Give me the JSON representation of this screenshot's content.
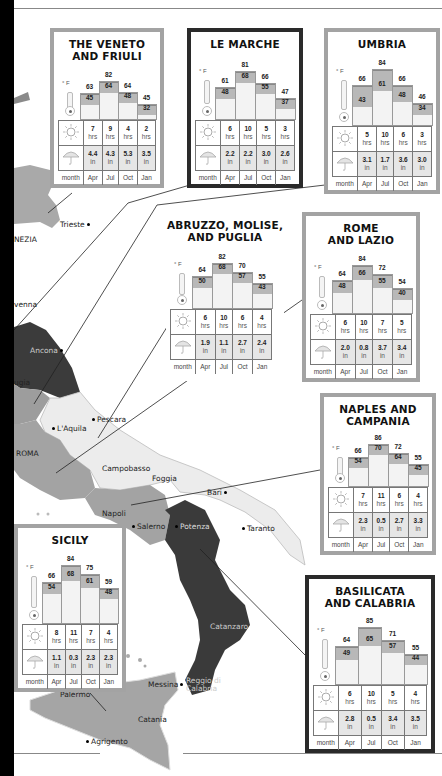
{
  "map": {
    "places": [
      {
        "name": "Trieste",
        "x": 60,
        "y": 224
      },
      {
        "name": "NEZIA",
        "x": 14,
        "y": 238
      },
      {
        "name": "venna",
        "x": 14,
        "y": 303
      },
      {
        "name": "Ancona",
        "x": 30,
        "y": 349
      },
      {
        "name": "ugia",
        "x": 14,
        "y": 381
      },
      {
        "name": "Pescara",
        "x": 94,
        "y": 418
      },
      {
        "name": "L'Aquila",
        "x": 54,
        "y": 427
      },
      {
        "name": "ROMA",
        "x": 16,
        "y": 452
      },
      {
        "name": "Campobasso",
        "x": 102,
        "y": 467
      },
      {
        "name": "Foggia",
        "x": 152,
        "y": 478
      },
      {
        "name": "Bari",
        "x": 207,
        "y": 491
      },
      {
        "name": "Napoli",
        "x": 102,
        "y": 512
      },
      {
        "name": "Salerno",
        "x": 135,
        "y": 525
      },
      {
        "name": "Potenza",
        "x": 178,
        "y": 525
      },
      {
        "name": "Taranto",
        "x": 245,
        "y": 527
      },
      {
        "name": "Catanzaro",
        "x": 210,
        "y": 625
      },
      {
        "name": "Messina",
        "x": 150,
        "y": 683
      },
      {
        "name": "Reggio di Calabria",
        "x": 186,
        "y": 680
      },
      {
        "name": "Palermo",
        "x": 60,
        "y": 693
      },
      {
        "name": "Catania",
        "x": 138,
        "y": 718
      },
      {
        "name": "Agrigento",
        "x": 88,
        "y": 740
      }
    ]
  },
  "climate_legend": {
    "unit_temp": "° F",
    "sun_unit": "hrs",
    "rain_unit": "in",
    "month_label": "month",
    "months": [
      "Apr",
      "Jul",
      "Oct",
      "Jan"
    ],
    "icons": [
      "thermometer-icon",
      "sun-icon",
      "umbrella-icon"
    ]
  },
  "chart_data": [
    {
      "type": "bar",
      "title": "THE VENETO AND FRIULI",
      "categories": [
        "Apr",
        "Jul",
        "Oct",
        "Jan"
      ],
      "series": [
        {
          "name": "high °F",
          "values": [
            63,
            82,
            64,
            45
          ]
        },
        {
          "name": "low °F",
          "values": [
            45,
            64,
            48,
            32
          ]
        },
        {
          "name": "sunshine hrs",
          "values": [
            7,
            9,
            4,
            2
          ]
        },
        {
          "name": "rainfall in",
          "values": [
            4.4,
            4.3,
            5.3,
            3.5
          ]
        }
      ]
    },
    {
      "type": "bar",
      "title": "LE MARCHE",
      "categories": [
        "Apr",
        "Jul",
        "Oct",
        "Jan"
      ],
      "series": [
        {
          "name": "high °F",
          "values": [
            61,
            81,
            66,
            47
          ]
        },
        {
          "name": "low °F",
          "values": [
            48,
            68,
            55,
            37
          ]
        },
        {
          "name": "sunshine hrs",
          "values": [
            6,
            10,
            5,
            3
          ]
        },
        {
          "name": "rainfall in",
          "values": [
            2.2,
            2.2,
            3.0,
            2.6
          ]
        }
      ]
    },
    {
      "type": "bar",
      "title": "UMBRIA",
      "categories": [
        "Apr",
        "Jul",
        "Oct",
        "Jan"
      ],
      "series": [
        {
          "name": "high °F",
          "values": [
            66,
            84,
            66,
            46
          ]
        },
        {
          "name": "low °F",
          "values": [
            43,
            61,
            48,
            34
          ]
        },
        {
          "name": "sunshine hrs",
          "values": [
            5,
            10,
            6,
            3
          ]
        },
        {
          "name": "rainfall in",
          "values": [
            3.1,
            1.7,
            3.6,
            3.0
          ]
        }
      ]
    },
    {
      "type": "bar",
      "title": "ABRUZZO, MOLISE, AND PUGLIA",
      "categories": [
        "Apr",
        "Jul",
        "Oct",
        "Jan"
      ],
      "series": [
        {
          "name": "high °F",
          "values": [
            64,
            82,
            70,
            55
          ]
        },
        {
          "name": "low °F",
          "values": [
            50,
            68,
            57,
            43
          ]
        },
        {
          "name": "sunshine hrs",
          "values": [
            6,
            10,
            6,
            4
          ]
        },
        {
          "name": "rainfall in",
          "values": [
            1.9,
            1.1,
            2.7,
            2.4
          ]
        }
      ]
    },
    {
      "type": "bar",
      "title": "ROME AND LAZIO",
      "categories": [
        "Apr",
        "Jul",
        "Oct",
        "Jan"
      ],
      "series": [
        {
          "name": "high °F",
          "values": [
            64,
            84,
            72,
            54
          ]
        },
        {
          "name": "low °F",
          "values": [
            48,
            66,
            55,
            40
          ]
        },
        {
          "name": "sunshine hrs",
          "values": [
            6,
            10,
            7,
            5
          ]
        },
        {
          "name": "rainfall in",
          "values": [
            2.0,
            0.8,
            3.7,
            3.4
          ]
        }
      ]
    },
    {
      "type": "bar",
      "title": "NAPLES AND CAMPANIA",
      "categories": [
        "Apr",
        "Jul",
        "Oct",
        "Jan"
      ],
      "series": [
        {
          "name": "high °F",
          "values": [
            66,
            86,
            72,
            55
          ]
        },
        {
          "name": "low °F",
          "values": [
            54,
            70,
            64,
            45
          ]
        },
        {
          "name": "sunshine hrs",
          "values": [
            7,
            11,
            6,
            4
          ]
        },
        {
          "name": "rainfall in",
          "values": [
            2.3,
            0.5,
            2.7,
            3.3
          ]
        }
      ]
    },
    {
      "type": "bar",
      "title": "SICILY",
      "categories": [
        "Apr",
        "Jul",
        "Oct",
        "Jan"
      ],
      "series": [
        {
          "name": "high °F",
          "values": [
            66,
            84,
            75,
            59
          ]
        },
        {
          "name": "low °F",
          "values": [
            54,
            68,
            61,
            48
          ]
        },
        {
          "name": "sunshine hrs",
          "values": [
            8,
            11,
            7,
            4
          ]
        },
        {
          "name": "rainfall in",
          "values": [
            1.1,
            0.3,
            2.3,
            2.3
          ]
        }
      ]
    },
    {
      "type": "bar",
      "title": "BASILICATA AND CALABRIA",
      "categories": [
        "Apr",
        "Jul",
        "Oct",
        "Jan"
      ],
      "series": [
        {
          "name": "high °F",
          "values": [
            64,
            85,
            71,
            55
          ]
        },
        {
          "name": "low °F",
          "values": [
            49,
            65,
            57,
            44
          ]
        },
        {
          "name": "sunshine hrs",
          "values": [
            6,
            10,
            5,
            4
          ]
        },
        {
          "name": "rainfall in",
          "values": [
            2.8,
            0.5,
            3.4,
            3.5
          ]
        }
      ]
    }
  ],
  "panels": [
    {
      "key": "veneto",
      "title_lines": [
        "THE VENETO",
        "AND FRIULI"
      ],
      "x": 50,
      "y": 28,
      "w": 114,
      "h": 160,
      "style": "light"
    },
    {
      "key": "marche",
      "title_lines": [
        "LE MARCHE"
      ],
      "x": 187,
      "y": 28,
      "w": 116,
      "h": 160,
      "style": "dark"
    },
    {
      "key": "umbria",
      "title_lines": [
        "UMBRIA"
      ],
      "x": 324,
      "y": 28,
      "w": 116,
      "h": 166,
      "style": "light"
    },
    {
      "key": "abruzzo",
      "title_lines": [
        "ABRUZZO, MOLISE,",
        "AND PUGLIA"
      ],
      "x": 166,
      "y": 213,
      "w": 118,
      "h": 168,
      "style": "none"
    },
    {
      "key": "rome",
      "title_lines": [
        "ROME",
        "AND LAZIO"
      ],
      "x": 302,
      "y": 212,
      "w": 118,
      "h": 170,
      "style": "light"
    },
    {
      "key": "naples",
      "title_lines": [
        "NAPLES AND",
        "CAMPANIA"
      ],
      "x": 320,
      "y": 393,
      "w": 116,
      "h": 162,
      "style": "light"
    },
    {
      "key": "sicily",
      "title_lines": [
        "SICILY"
      ],
      "x": 14,
      "y": 524,
      "w": 112,
      "h": 168,
      "style": "light"
    },
    {
      "key": "basilicata",
      "title_lines": [
        "BASILICATA",
        "AND CALABRIA"
      ],
      "x": 305,
      "y": 575,
      "w": 130,
      "h": 178,
      "style": "dark"
    }
  ]
}
